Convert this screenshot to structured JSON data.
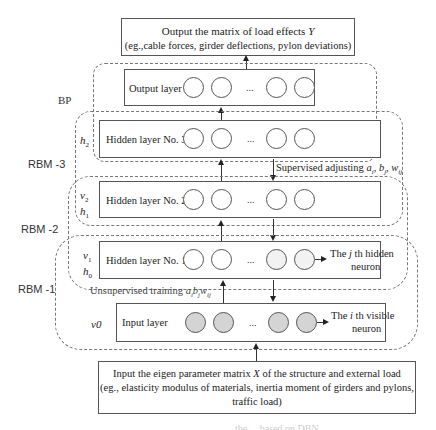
{
  "output_box": {
    "line1": "Output the matrix of load effects Y",
    "line2": "(eg.,cable forces, girder deflections, pylon deviations)"
  },
  "groups": {
    "bp": "BP",
    "rbm3": "RBM -3",
    "rbm2": "RBM -2",
    "rbm1": "RBM -1"
  },
  "layers": {
    "output": {
      "label": "Output layer"
    },
    "hidden3": {
      "label": "Hidden layer No. 3",
      "side": [
        "h2"
      ]
    },
    "hidden2": {
      "label": "Hidden layer No. 2",
      "side": [
        "v2",
        "h1"
      ]
    },
    "hidden1": {
      "label": "Hidden layer No. 1",
      "side": [
        "v1",
        "h0"
      ]
    },
    "input": {
      "label": "Input layer",
      "side": [
        "v0"
      ]
    }
  },
  "ellipsis": "...",
  "annotations": {
    "supervised": "Supervised adjusting a",
    "supervised_full": "Supervised adjusting a_i, b_j, w_ij",
    "unsupervised": "Unsupervised training a",
    "unsupervised_full": "Unsupervised training a_i b_j w_ij",
    "hidden_neuron_1": "The j th hidden",
    "hidden_neuron_2": "neuron",
    "visible_neuron_1": "The i th visible",
    "visible_neuron_2": "neuron"
  },
  "input_box": {
    "line1": "Input the eigen parameter matrix X of the structure and external load",
    "line2": "(eg., elasticity modulus of materials, inertia moment of girders and pylons,",
    "line3": "traffic load)"
  },
  "caption_partial": "... the ... based on DBN"
}
